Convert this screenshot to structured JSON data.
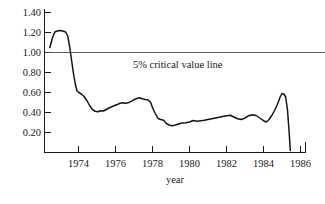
{
  "chart_data": {
    "type": "line",
    "title": "",
    "xlabel": "year",
    "ylabel": "",
    "xlim": [
      1972.3,
      1986.4
    ],
    "ylim": [
      0.0,
      1.45
    ],
    "grid": false,
    "legend": "none",
    "x_ticks": [
      1974,
      1976,
      1978,
      1980,
      1982,
      1984,
      1986
    ],
    "x_tick_labels": [
      "1974",
      "1976",
      "1978",
      "1980",
      "1982",
      "1984",
      "1986"
    ],
    "y_ticks": [
      0.2,
      0.4,
      0.6,
      0.8,
      1.0,
      1.2,
      1.4
    ],
    "y_tick_labels": [
      "0.20",
      "0.40",
      "0.60",
      "0.80",
      "1.00",
      "1.20",
      "1.40"
    ],
    "annotations": [
      {
        "name": "critical-value-line",
        "text": "5% critical value line",
        "y_value": 1.0,
        "type": "horizontal-reference-line"
      }
    ],
    "series": [
      {
        "name": "test statistic",
        "points": [
          [
            1972.45,
            1.05
          ],
          [
            1972.6,
            1.15
          ],
          [
            1972.72,
            1.205
          ],
          [
            1972.85,
            1.215
          ],
          [
            1973.0,
            1.22
          ],
          [
            1973.15,
            1.215
          ],
          [
            1973.3,
            1.205
          ],
          [
            1973.42,
            1.165
          ],
          [
            1973.52,
            1.06
          ],
          [
            1973.62,
            0.93
          ],
          [
            1973.72,
            0.8
          ],
          [
            1973.82,
            0.69
          ],
          [
            1973.92,
            0.615
          ],
          [
            1974.02,
            0.6
          ],
          [
            1974.15,
            0.585
          ],
          [
            1974.3,
            0.56
          ],
          [
            1974.45,
            0.52
          ],
          [
            1974.6,
            0.47
          ],
          [
            1974.75,
            0.43
          ],
          [
            1974.9,
            0.412
          ],
          [
            1975.05,
            0.408
          ],
          [
            1975.2,
            0.418
          ],
          [
            1975.35,
            0.415
          ],
          [
            1975.5,
            0.43
          ],
          [
            1975.65,
            0.445
          ],
          [
            1975.8,
            0.458
          ],
          [
            1975.95,
            0.47
          ],
          [
            1976.1,
            0.48
          ],
          [
            1976.25,
            0.492
          ],
          [
            1976.4,
            0.498
          ],
          [
            1976.55,
            0.492
          ],
          [
            1976.7,
            0.498
          ],
          [
            1976.85,
            0.512
          ],
          [
            1977.0,
            0.528
          ],
          [
            1977.15,
            0.54
          ],
          [
            1977.3,
            0.548
          ],
          [
            1977.45,
            0.538
          ],
          [
            1977.6,
            0.53
          ],
          [
            1977.75,
            0.528
          ],
          [
            1977.9,
            0.5
          ],
          [
            1978.02,
            0.44
          ],
          [
            1978.15,
            0.39
          ],
          [
            1978.3,
            0.34
          ],
          [
            1978.45,
            0.33
          ],
          [
            1978.6,
            0.322
          ],
          [
            1978.75,
            0.29
          ],
          [
            1978.9,
            0.275
          ],
          [
            1979.05,
            0.268
          ],
          [
            1979.2,
            0.272
          ],
          [
            1979.4,
            0.285
          ],
          [
            1979.6,
            0.295
          ],
          [
            1979.8,
            0.298
          ],
          [
            1980.0,
            0.305
          ],
          [
            1980.2,
            0.32
          ],
          [
            1980.4,
            0.312
          ],
          [
            1980.6,
            0.318
          ],
          [
            1980.8,
            0.322
          ],
          [
            1981.0,
            0.33
          ],
          [
            1981.2,
            0.338
          ],
          [
            1981.4,
            0.345
          ],
          [
            1981.6,
            0.352
          ],
          [
            1981.8,
            0.36
          ],
          [
            1982.0,
            0.368
          ],
          [
            1982.2,
            0.372
          ],
          [
            1982.4,
            0.355
          ],
          [
            1982.6,
            0.338
          ],
          [
            1982.8,
            0.33
          ],
          [
            1983.0,
            0.345
          ],
          [
            1983.2,
            0.368
          ],
          [
            1983.4,
            0.378
          ],
          [
            1983.6,
            0.37
          ],
          [
            1983.8,
            0.345
          ],
          [
            1984.0,
            0.318
          ],
          [
            1984.15,
            0.305
          ],
          [
            1984.3,
            0.33
          ],
          [
            1984.45,
            0.37
          ],
          [
            1984.6,
            0.42
          ],
          [
            1984.75,
            0.48
          ],
          [
            1984.9,
            0.555
          ],
          [
            1985.0,
            0.59
          ],
          [
            1985.1,
            0.585
          ],
          [
            1985.2,
            0.555
          ],
          [
            1985.3,
            0.42
          ],
          [
            1985.38,
            0.22
          ],
          [
            1985.45,
            0.02
          ]
        ]
      }
    ]
  },
  "axes": {
    "y_axis_name": "value-axis",
    "x_axis_name": "year-axis"
  }
}
